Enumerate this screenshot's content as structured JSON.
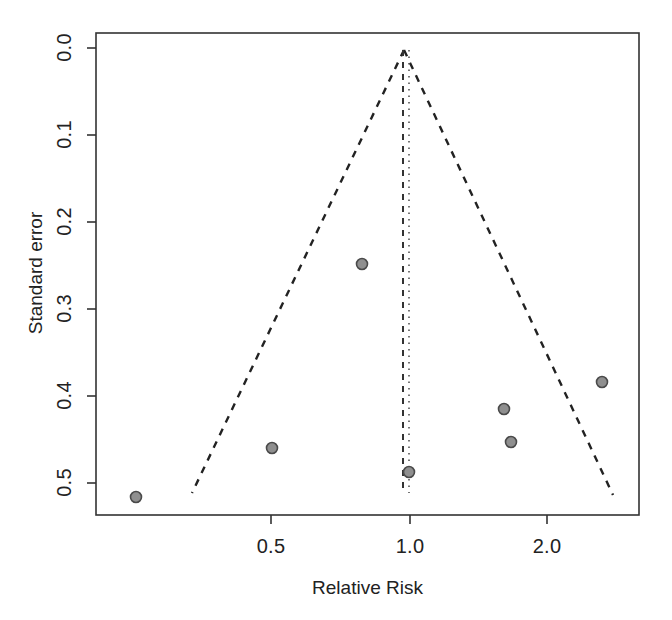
{
  "chart_data": {
    "type": "scatter",
    "title": "",
    "subtitle": "",
    "xlabel": "Relative Risk",
    "ylabel": "Standard error",
    "x_scale": "log",
    "y_inverted": true,
    "grid": false,
    "legend": null,
    "xlim": [
      0.09,
      3.0
    ],
    "ylim": [
      0.545,
      -0.012
    ],
    "x_ticks": [
      {
        "value": 0.5,
        "label": "0.5",
        "px": 271
      },
      {
        "value": 1.0,
        "label": "1.0",
        "px": 410
      },
      {
        "value": 2.0,
        "label": "2.0",
        "px": 547
      }
    ],
    "y_ticks": [
      {
        "value": 0.0,
        "label": "0.0",
        "px": 48
      },
      {
        "value": 0.1,
        "label": "0.1",
        "px": 135
      },
      {
        "value": 0.2,
        "label": "0.2",
        "px": 222
      },
      {
        "value": 0.3,
        "label": "0.3",
        "px": 309
      },
      {
        "value": 0.4,
        "label": "0.4",
        "px": 396
      },
      {
        "value": 0.5,
        "label": "0.5",
        "px": 483
      }
    ],
    "points": [
      {
        "x": 0.105,
        "y": 0.515,
        "px": 136,
        "py": 497
      },
      {
        "x": 0.5,
        "y": 0.488,
        "px": 272,
        "py": 448
      },
      {
        "x": 0.8,
        "y": 0.259,
        "px": 362,
        "py": 264
      },
      {
        "x": 0.99,
        "y": 0.502,
        "px": 409,
        "py": 472
      },
      {
        "x": 1.6,
        "y": 0.43,
        "px": 504,
        "py": 409
      },
      {
        "x": 1.67,
        "y": 0.468,
        "px": 511,
        "py": 442
      },
      {
        "x": 2.55,
        "y": 0.398,
        "px": 602,
        "py": 382
      }
    ],
    "point_style": {
      "marker": "circle",
      "fill_color": "#8f8f8f",
      "edge_color": "#4a4a4a",
      "radius": 5.5
    },
    "funnel": {
      "apex": {
        "x": 0.97,
        "y": 0.0,
        "px": 404,
        "py": 50
      },
      "left_base": {
        "px": 192,
        "py": 493
      },
      "right_base": {
        "px": 613,
        "py": 495
      },
      "line_style": "dashed",
      "line_color": "#222222"
    },
    "reference_lines": [
      {
        "name": "pooled-estimate-dashed",
        "px": 403,
        "style": "dashed",
        "color": "#333333"
      },
      {
        "name": "null-effect-dotted",
        "px": 409,
        "style": "dotted",
        "color": "#555555"
      }
    ],
    "plot_box": {
      "left": 96,
      "top": 33,
      "right": 639,
      "bottom": 515
    },
    "frame_color": "#333333"
  },
  "axes": {
    "x_title": "Relative Risk",
    "y_title": "Standard error",
    "x_tick_labels": [
      "0.5",
      "1.0",
      "2.0"
    ],
    "y_tick_labels": [
      "0.0",
      "0.1",
      "0.2",
      "0.3",
      "0.4",
      "0.5"
    ]
  }
}
